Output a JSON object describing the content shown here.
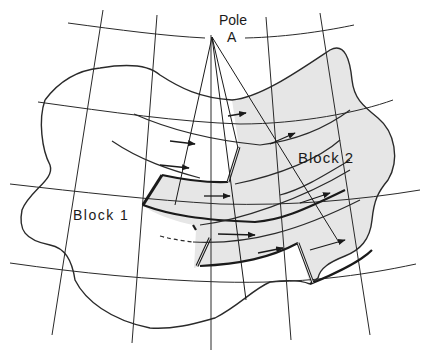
{
  "figure": {
    "type": "plate-tectonics-schematic",
    "labels": {
      "pole_line1": "Pole",
      "pole_line2": "A",
      "block1": "Block 1",
      "block2": "Block 2"
    },
    "colors": {
      "background": "#ffffff",
      "lines": "#1a1a1a",
      "block2_fill": "#e6e6e6"
    },
    "elements": {
      "pole": "Pole A (rotation pole with radiating great-circle lines)",
      "blocks": [
        "Block 1",
        "Block 2"
      ],
      "motion_arrows": 9,
      "transform_faults": 3
    }
  }
}
